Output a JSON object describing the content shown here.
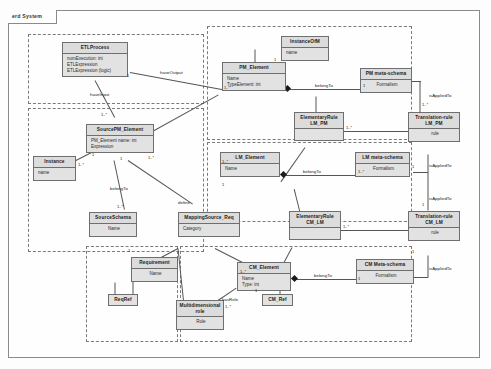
{
  "frame": {
    "label": "erd System"
  },
  "packages": [
    {
      "name": "etl-process-package"
    },
    {
      "name": "source-pm-package"
    },
    {
      "name": "pm-level-package"
    },
    {
      "name": "lm-level-package"
    },
    {
      "name": "cm-level-package"
    },
    {
      "name": "requirement-package"
    }
  ],
  "classes": {
    "etl_process": {
      "title": "ETLProcess",
      "attrs": [
        "numExecution:  int",
        "ETLExpression",
        "ETLExpression (logic)"
      ]
    },
    "instance_of": {
      "title": "InstanceOfM",
      "attrs": [
        "name"
      ]
    },
    "pm_element": {
      "title": "PM_Element",
      "attrs": [
        "Name",
        "TypeElement: int"
      ]
    },
    "pm_meta": {
      "title": "PM meta-schema",
      "attrs": [
        "Formalism"
      ]
    },
    "elem_rule_lm_pm": {
      "title": "ElementaryRule\nLM_PM",
      "attrs": [
        ""
      ]
    },
    "trans_rule_lm_pm": {
      "title": "Translation-rule\nLM_PM",
      "attrs": [
        "rule"
      ]
    },
    "source_pm": {
      "title": "SourcePM_Element",
      "attrs": [
        "PM_Element name:  int",
        "Expression"
      ]
    },
    "instance": {
      "title": "Instance",
      "attrs": [
        "name"
      ]
    },
    "source_schema": {
      "title": "SourceSchema",
      "attrs": [
        "Name"
      ]
    },
    "lm_element": {
      "title": "LM_Element",
      "attrs": [
        "Name"
      ]
    },
    "lm_meta": {
      "title": "LM meta-schema",
      "attrs": [
        "Formalism"
      ]
    },
    "elem_rule_cm_lm": {
      "title": "ElementaryRule\nCM_LM",
      "attrs": [
        ""
      ]
    },
    "trans_rule_cm_lm": {
      "title": "Translation-rule\nCM_LM",
      "attrs": [
        "rule"
      ]
    },
    "mapping_source": {
      "title": "MappingSource_Req",
      "attrs": [
        "Category"
      ]
    },
    "requirement": {
      "title": "Requirement",
      "attrs": [
        "Name"
      ]
    },
    "req_ref": {
      "title": "ReqRef",
      "attrs": []
    },
    "multidim_role": {
      "title": "Multidimensional\nrole",
      "attrs": [
        "Role"
      ]
    },
    "cm_element": {
      "title": "CM_Element",
      "attrs": [
        "Name",
        "Type:  int"
      ]
    },
    "cm_ref": {
      "title": "CM_Ref",
      "attrs": []
    },
    "cm_meta": {
      "title": "CM Meta-schema",
      "attrs": [
        "Formalism"
      ]
    }
  },
  "edge_labels": {
    "have_output": "haveOutput",
    "have_input": "haveInput",
    "belong_to_pm": "belongTo",
    "belong_to_lm": "belongTo",
    "belong_to_cm": "belongTo",
    "belong_to_source": "belongTo",
    "is_applied_to_1": "isAppliedTo",
    "is_applied_to_2": "isAppliedTo",
    "is_applied_to_3": "isAppliedTo",
    "is_applied_to_4": "isAppliedTo",
    "define": "define",
    "has_role": "hasRole"
  },
  "multiplicities": {
    "m1": "1..*",
    "m2": "1",
    "m3": "1..*",
    "m4": "1",
    "m5": "1..*",
    "m6": "1",
    "m7": "1..*",
    "m8": "1",
    "m9": "1..*",
    "m10": "1",
    "m11": "1..*",
    "m12": "1",
    "m13": "1..*",
    "m14": "1",
    "m15": "1..*",
    "m16": "1",
    "m17": "1..*",
    "m18": "1",
    "m19": "1..*",
    "m20": "1",
    "m21": "1..*",
    "m22": "1",
    "m23": "1..*",
    "m24": "1"
  },
  "colors": {
    "class_fill": "#e2e2e2",
    "header_fill": "#dcdcdc",
    "line": "#555555",
    "frame": "#8a8a8a"
  }
}
